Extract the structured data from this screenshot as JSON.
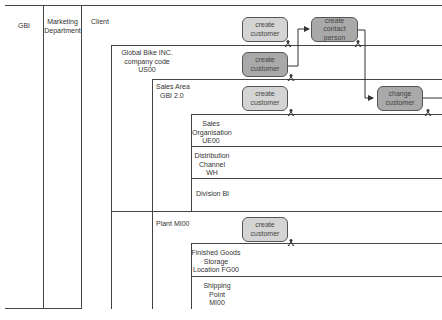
{
  "lanes": {
    "org": "GBI",
    "department": "Marketing Department",
    "client": "Client"
  },
  "org_units": {
    "company_code": "Global Bike INC. company code US00",
    "company_code_lines": [
      "Global Bike INC.",
      "company code",
      "US00"
    ],
    "sales_area_lines": [
      "Sales Area",
      "GBI 2.0"
    ],
    "sales_org_lines": [
      "Sales",
      "Organisation",
      "UE00"
    ],
    "distribution_channel_lines": [
      "Distribution",
      "Channel",
      "WH"
    ],
    "division": "Division BI",
    "plant": "Plant MI00",
    "storage_location_lines": [
      "Finished Goods",
      "Storage",
      "Location FG00"
    ],
    "shipping_point_lines": [
      "Shipping",
      "Point",
      "MI00"
    ]
  },
  "tasks": [
    {
      "id": "t1",
      "lines": [
        "create",
        "customer"
      ],
      "shade": "light"
    },
    {
      "id": "t2",
      "lines": [
        "create",
        "contact person"
      ],
      "shade": "dark"
    },
    {
      "id": "t3",
      "lines": [
        "create",
        "customer"
      ],
      "shade": "dark"
    },
    {
      "id": "t4",
      "lines": [
        "create",
        "customer"
      ],
      "shade": "light"
    },
    {
      "id": "t5",
      "lines": [
        "change",
        "customer"
      ],
      "shade": "dark"
    },
    {
      "id": "t6",
      "lines": [
        "create",
        "customer"
      ],
      "shade": "light"
    }
  ],
  "colors": {
    "line": "#444444",
    "task_light": "#d4d4d4",
    "task_dark": "#a9a9a9"
  }
}
